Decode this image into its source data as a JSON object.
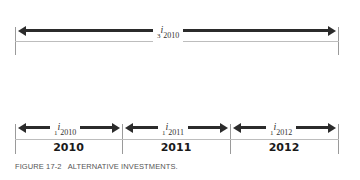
{
  "top_span": {
    "prefix": "3",
    "symbol": "i",
    "subscript": "2010"
  },
  "segments": [
    {
      "prefix": "1",
      "symbol": "i",
      "subscript": "2010",
      "year": "2010"
    },
    {
      "prefix": "1",
      "symbol": "i",
      "subscript": "2011",
      "year": "2011"
    },
    {
      "prefix": "1",
      "symbol": "i",
      "subscript": "2012",
      "year": "2012"
    }
  ],
  "caption": "FIGURE 17-2   ALTERNATIVE INVESTMENTS.",
  "colors": {
    "arrow": "#2b2b2b",
    "rule": "#bdbdbd",
    "text": "#333333"
  }
}
